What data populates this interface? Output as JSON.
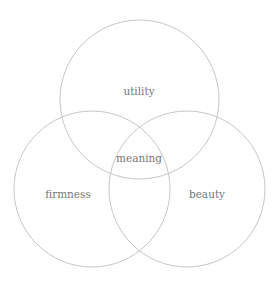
{
  "diagram": {
    "type": "venn",
    "colors": {
      "background": "#ffffff",
      "stroke": "#b8b8b8",
      "text": "#777777"
    },
    "circles": [
      {
        "id": "utility",
        "label": "utility",
        "cx": 139.5,
        "cy": 99.5,
        "r": 79.5
      },
      {
        "id": "firmness",
        "label": "firmness",
        "cx": 92,
        "cy": 189,
        "r": 78
      },
      {
        "id": "beauty",
        "label": "beauty",
        "cx": 187,
        "cy": 189,
        "r": 78
      }
    ],
    "labels": {
      "utility": "utility",
      "firmness": "firmness",
      "beauty": "beauty",
      "center": "meaning"
    }
  }
}
